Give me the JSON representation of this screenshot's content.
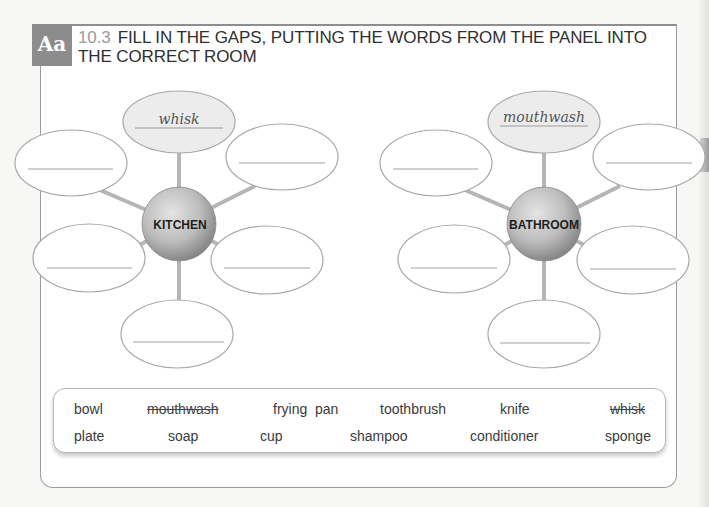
{
  "header": {
    "badge": "Aa",
    "number": "10.3",
    "title": "FILL IN THE GAPS, PUTTING THE WORDS FROM THE PANEL INTO THE CORRECT ROOM"
  },
  "diagrams": [
    {
      "room": "KITCHEN",
      "example_answer": "whisk",
      "blanks": [
        "",
        "",
        "",
        "",
        ""
      ]
    },
    {
      "room": "BATHROOM",
      "example_answer": "mouthwash",
      "blanks": [
        "",
        "",
        "",
        "",
        ""
      ]
    }
  ],
  "word_panel": {
    "row1": [
      {
        "text": "bowl",
        "struck": false
      },
      {
        "text": "mouthwash",
        "struck": true
      },
      {
        "text": "frying  pan",
        "struck": false
      },
      {
        "text": "toothbrush",
        "struck": false
      },
      {
        "text": "knife",
        "struck": false
      },
      {
        "text": "whisk",
        "struck": true
      }
    ],
    "row2": [
      {
        "text": "plate",
        "struck": false
      },
      {
        "text": "soap",
        "struck": false
      },
      {
        "text": "cup",
        "struck": false
      },
      {
        "text": "shampoo",
        "struck": false
      },
      {
        "text": "conditioner",
        "struck": false
      },
      {
        "text": "sponge",
        "struck": false
      }
    ]
  },
  "colors": {
    "badge": "#8c8c8c",
    "example_bubble": "#ececec",
    "outline": "#a8a8a8",
    "spoke": "#b5b5b5"
  }
}
